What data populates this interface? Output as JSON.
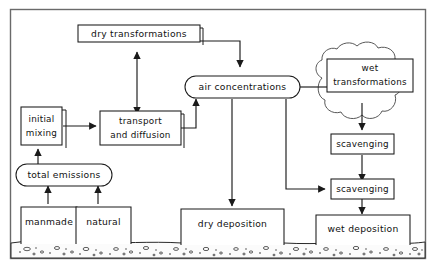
{
  "diagram": {
    "frame": {
      "border_color": "#6a6a6a"
    },
    "ink_color": "#1a1a1a",
    "background_color": "#ffffff",
    "ground": {
      "label": "soil ground stipple band",
      "fill": "#fbfbfb"
    },
    "cloud": {
      "label": "cloud region enclosing wet processes"
    },
    "nodes": [
      {
        "id": "dry_transformations",
        "label": "dry transformations",
        "shape": "rect-shadow"
      },
      {
        "id": "air_concentrations",
        "label": "air concentrations",
        "shape": "stadium"
      },
      {
        "id": "initial_mixing",
        "label_line1": "initial",
        "label_line2": "mixing",
        "shape": "rect-shadow"
      },
      {
        "id": "transport_and_diffusion",
        "label_line1": "transport",
        "label_line2": "and  diffusion",
        "shape": "rect-shadow"
      },
      {
        "id": "total_emissions",
        "label": "total  emissions",
        "shape": "stadium"
      },
      {
        "id": "manmade",
        "label": "manmade",
        "shape": "rect-open-bottom"
      },
      {
        "id": "natural",
        "label": "natural",
        "shape": "rect-open-bottom"
      },
      {
        "id": "dry_deposition",
        "label": "dry  deposition",
        "shape": "rect-open-bottom"
      },
      {
        "id": "wet_transformations",
        "label_line1": "wet",
        "label_line2": "transformations",
        "shape": "rect"
      },
      {
        "id": "scavenging_cloud",
        "label": "scavenging",
        "shape": "rect"
      },
      {
        "id": "scavenging_below",
        "label": "scavenging",
        "shape": "rect"
      },
      {
        "id": "wet_deposition",
        "label": "wet deposition",
        "shape": "rect-open-bottom"
      }
    ],
    "edges": [
      {
        "from": "dry_transformations",
        "to": "air_concentrations",
        "arrow": "single"
      },
      {
        "from": "transport_and_diffusion",
        "to": "dry_transformations",
        "arrow": "double"
      },
      {
        "from": "initial_mixing",
        "to": "transport_and_diffusion",
        "arrow": "single"
      },
      {
        "from": "transport_and_diffusion",
        "to": "air_concentrations",
        "arrow": "single"
      },
      {
        "from": "total_emissions",
        "to": "initial_mixing",
        "arrow": "single"
      },
      {
        "from": "manmade",
        "to": "total_emissions",
        "arrow": "single"
      },
      {
        "from": "natural",
        "to": "total_emissions",
        "arrow": "single"
      },
      {
        "from": "air_concentrations",
        "to": "dry_deposition",
        "arrow": "single"
      },
      {
        "from": "air_concentrations",
        "to": "scavenging_below",
        "arrow": "single"
      },
      {
        "from": "air_concentrations",
        "to": "wet_transformations",
        "arrow": "none"
      },
      {
        "from": "wet_transformations",
        "to": "scavenging_cloud",
        "arrow": "single"
      },
      {
        "from": "scavenging_cloud",
        "to": "scavenging_below",
        "arrow": "single"
      },
      {
        "from": "scavenging_below",
        "to": "wet_deposition",
        "arrow": "single"
      }
    ]
  }
}
